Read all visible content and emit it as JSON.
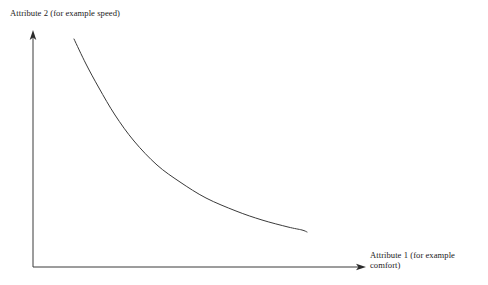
{
  "figure": {
    "background_color": "#ffffff",
    "line_color": "#3a3a3a",
    "text_color": "#1a1a1a",
    "width": 488,
    "height": 285
  },
  "axes": {
    "y": {
      "label": "Attribute 2 (for example speed)",
      "arrow": "up-arrowhead"
    },
    "x": {
      "label": "Attribute 1 (for example\ncomfort)",
      "arrow": "right-arrowhead"
    }
  },
  "chart_data": {
    "type": "line",
    "title": "",
    "xlabel": "Attribute 1 (for example comfort)",
    "ylabel": "Attribute 2 (for example speed)",
    "grid": false,
    "legend": "none",
    "axis_style": "arrow-axes-no-ticks",
    "xlim": [
      0,
      1
    ],
    "ylim": [
      0,
      1
    ],
    "series": [
      {
        "name": "trade-off curve",
        "description": "Monotonically decreasing convex (hyperbolic) trade-off frontier between Attribute 1 and Attribute 2",
        "x": [
          0.123,
          0.16,
          0.2,
          0.25,
          0.31,
          0.38,
          0.45,
          0.53,
          0.62,
          0.7,
          0.78,
          0.823
        ],
        "y": [
          0.966,
          0.86,
          0.76,
          0.648,
          0.54,
          0.44,
          0.368,
          0.302,
          0.248,
          0.21,
          0.182,
          0.169
        ]
      }
    ],
    "pixel_points": [
      [
        74,
        39
      ],
      [
        86,
        64
      ],
      [
        99,
        88
      ],
      [
        115,
        115
      ],
      [
        134,
        141
      ],
      [
        157,
        165
      ],
      [
        180,
        182
      ],
      [
        206,
        198
      ],
      [
        236,
        211
      ],
      [
        262,
        220
      ],
      [
        288,
        227
      ],
      [
        302,
        230
      ],
      [
        307,
        232
      ]
    ]
  }
}
